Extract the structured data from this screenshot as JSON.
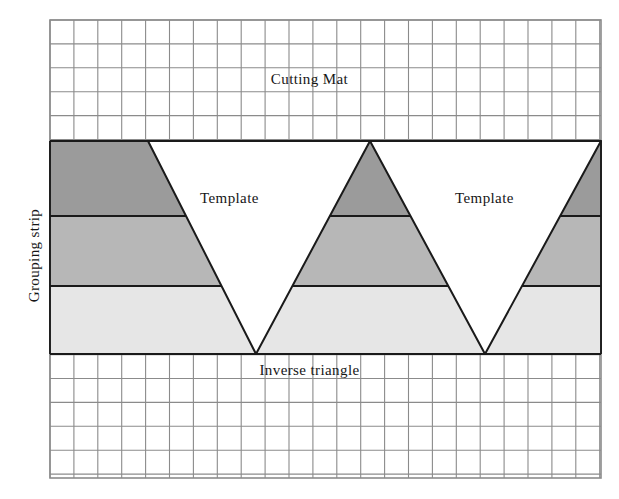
{
  "figure": {
    "title_top": "Cutting Mat",
    "title_bottom": "Inverse triangle",
    "side_label": "Grouping strip",
    "template_label_left": "Template",
    "template_label_right": "Template",
    "colors": {
      "band_dark": "#9b9b9b",
      "band_medium": "#b7b7b7",
      "band_light": "#e6e6e6",
      "grid_line": "#8b8b8b",
      "outline": "#1a1a1a",
      "background": "#ffffff",
      "text": "#161616"
    },
    "grid": {
      "left": 50,
      "top": 20,
      "right": 601,
      "bottom": 478,
      "cell_size": 23.9,
      "columns": 23,
      "rows": 19
    },
    "strip": {
      "top": 141,
      "bottom": 354,
      "left": 50,
      "right": 601,
      "band_boundaries": [
        141,
        216,
        286,
        354
      ]
    },
    "shapes": [
      {
        "name": "inverse-triangle-1",
        "type": "inverted",
        "apex_x": 256,
        "top_left_x": 148,
        "top_right_x": 370
      },
      {
        "name": "upright-triangle-1",
        "type": "upright",
        "apex_x": 370,
        "bottom_left_x": 256,
        "bottom_right_x": 485
      },
      {
        "name": "inverse-triangle-2",
        "type": "inverted",
        "apex_x": 485,
        "top_left_x": 370,
        "top_right_x": 601
      }
    ]
  }
}
